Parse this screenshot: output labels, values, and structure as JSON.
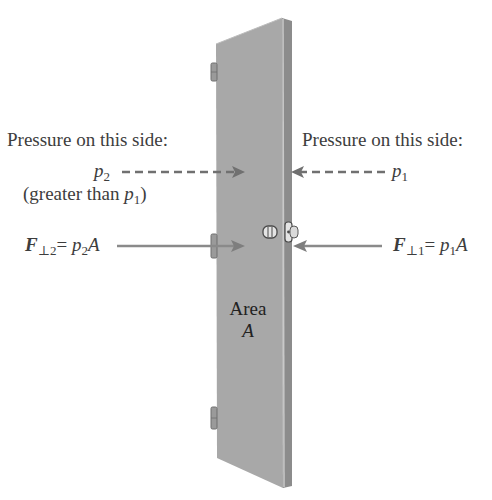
{
  "figure": {
    "left_side": {
      "heading": "Pressure on this side:",
      "pressure_symbol": "p",
      "pressure_subscript": "2",
      "note_prefix": "(greater than ",
      "note_symbol": "p",
      "note_subscript": "1",
      "note_suffix": ")",
      "force_symbol": "F",
      "force_subscript": "⊥2",
      "force_equals": "= ",
      "force_rhs_symbol": "p",
      "force_rhs_subscript": "2",
      "force_rhs_area": "A"
    },
    "right_side": {
      "heading": "Pressure on this side:",
      "pressure_symbol": "p",
      "pressure_subscript": "1",
      "force_symbol": "F",
      "force_subscript": "⊥1",
      "force_equals": "= ",
      "force_rhs_symbol": "p",
      "force_rhs_subscript": "1",
      "force_rhs_area": "A"
    },
    "door": {
      "area_word": "Area",
      "area_symbol": "A"
    },
    "colors": {
      "door_face": "#a9a9a9",
      "door_edge": "#8e8e8e",
      "arrow": "#7a7a7a",
      "text": "#3d3d3d"
    }
  }
}
